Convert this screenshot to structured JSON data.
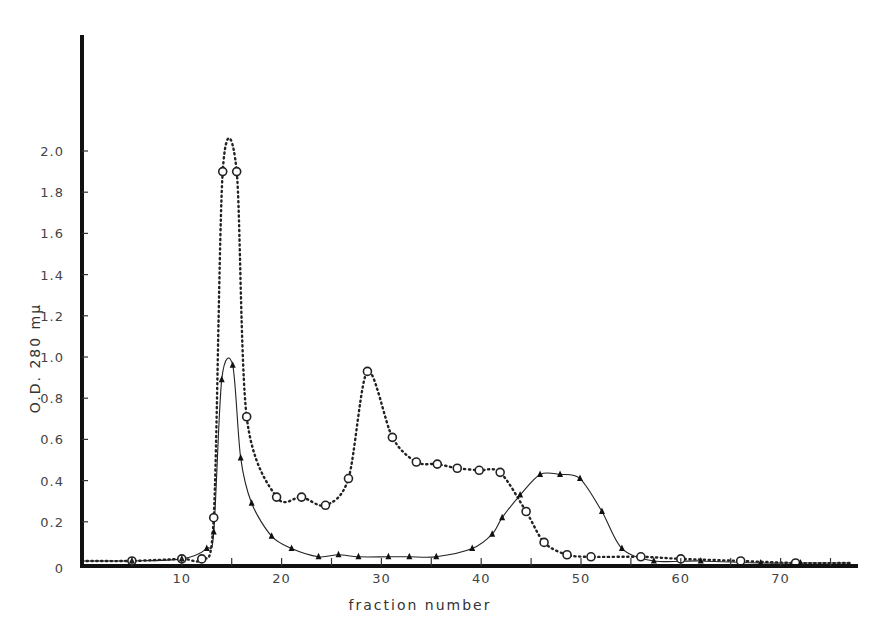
{
  "chart_data": {
    "type": "line",
    "title": "",
    "xlabel": "fraction number",
    "ylabel": "O.D. 280 mμ",
    "xlim": [
      0,
      77
    ],
    "ylim": [
      0,
      2.0
    ],
    "grid": false,
    "legend": null,
    "x_ticks": [
      10,
      20,
      30,
      40,
      50,
      60,
      70
    ],
    "x_tick_labels": [
      "10",
      "20",
      "30",
      "40",
      "50",
      "60",
      "70"
    ],
    "y_ticks": [
      0,
      0.2,
      0.4,
      0.6,
      0.8,
      1.0,
      1.2,
      1.4,
      1.6,
      1.8,
      2.0
    ],
    "y_tick_labels": [
      "0",
      "0.2",
      "0.4",
      "0.6",
      "0.8",
      "1.0",
      "1.2",
      "1.4",
      "1.6",
      "1.8",
      "2.0"
    ],
    "series": [
      {
        "name": "open circles (dotted line)",
        "marker": "circle",
        "line_style": "dotted",
        "x": [
          0,
          5,
          10,
          12,
          13.2,
          14.1,
          15.5,
          16.5,
          19.5,
          22,
          24.4,
          26.7,
          28.6,
          31.1,
          33.5,
          35.6,
          37.6,
          39.8,
          41.9,
          44.5,
          46.3,
          48.6,
          51,
          56,
          60,
          66,
          71.5,
          77
        ],
        "y": [
          0.01,
          0.01,
          0.02,
          0.02,
          0.22,
          1.9,
          1.9,
          0.71,
          0.32,
          0.32,
          0.28,
          0.41,
          0.93,
          0.61,
          0.49,
          0.48,
          0.46,
          0.45,
          0.44,
          0.25,
          0.1,
          0.04,
          0.03,
          0.03,
          0.02,
          0.01,
          0.0,
          0.0
        ]
      },
      {
        "name": "filled triangles (solid line)",
        "marker": "triangle",
        "line_style": "solid",
        "x": [
          0,
          5,
          10,
          12.5,
          13.2,
          14,
          15.1,
          15.9,
          17,
          19,
          21,
          23.7,
          25.7,
          27.7,
          30.7,
          32.8,
          35.5,
          39.1,
          41.1,
          42.1,
          43.9,
          45.9,
          47.9,
          49.9,
          52.1,
          54.1,
          57.3,
          62,
          68,
          72,
          77
        ],
        "y": [
          0.01,
          0.01,
          0.02,
          0.07,
          0.15,
          0.89,
          0.96,
          0.51,
          0.29,
          0.13,
          0.07,
          0.03,
          0.04,
          0.03,
          0.03,
          0.03,
          0.03,
          0.07,
          0.14,
          0.22,
          0.33,
          0.43,
          0.43,
          0.41,
          0.25,
          0.07,
          0.01,
          0.01,
          0.0,
          0.0,
          0.0
        ]
      }
    ]
  }
}
